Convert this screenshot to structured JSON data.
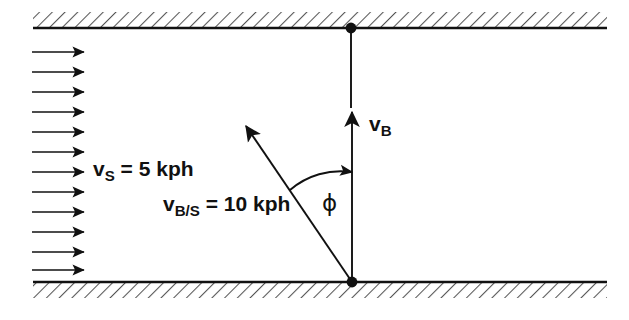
{
  "figure": {
    "type": "vector-diagram",
    "background_color": "#ffffff",
    "ink_color": "#111111",
    "hatch_color": "#555555"
  },
  "labels": {
    "stream_velocity": {
      "symbol": "v",
      "subscript": "S",
      "equals": " = 5 kph",
      "full_text": "v_S = 5 kph",
      "value": 5,
      "unit": "kph",
      "x": 93,
      "y": 158
    },
    "relative_velocity": {
      "symbol": "v",
      "subscript": "B/S",
      "equals": " = 10 kph",
      "full_text": "v_B/S = 10 kph",
      "value": 10,
      "unit": "kph",
      "x": 163,
      "y": 193
    },
    "boat_velocity": {
      "symbol": "v",
      "subscript": "B",
      "equals": "",
      "full_text": "v_B",
      "x": 369,
      "y": 113
    },
    "angle": {
      "symbol": "ϕ",
      "full_text": "ϕ",
      "x": 322,
      "y": 192
    }
  },
  "geometry": {
    "top_wall": {
      "x1": 33,
      "x2": 607,
      "y": 28,
      "hatch_side": "above",
      "hatch_height": 16
    },
    "bottom_wall": {
      "x1": 33,
      "x2": 607,
      "y": 282,
      "hatch_side": "below",
      "hatch_height": 16
    },
    "origin_dot": {
      "x": 352,
      "y": 282,
      "r": 5
    },
    "target_dot": {
      "x": 351,
      "y": 28,
      "r": 5
    },
    "boat_vector": {
      "x1": 352,
      "y1": 282,
      "x2": 352,
      "y2": 110,
      "arrow": "up"
    },
    "guide_line": {
      "x1": 351,
      "y1": 33,
      "x2": 351,
      "y2": 108
    },
    "relative_vector": {
      "x1": 352,
      "y1": 282,
      "x2": 243,
      "y2": 122,
      "arrow": "up-left"
    },
    "angle_arc": {
      "cx": 352,
      "cy": 282,
      "radius": 110,
      "from_deg": 90,
      "to_deg": 124
    },
    "stream_arrows": {
      "count": 12,
      "x_start": 32,
      "x_end": 88,
      "y_values": [
        52,
        72,
        92,
        112,
        132,
        152,
        172,
        192,
        212,
        232,
        252,
        270
      ]
    }
  }
}
